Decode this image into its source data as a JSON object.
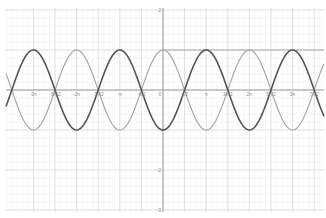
{
  "chart_data": {
    "type": "line",
    "title": "",
    "xlabel": "",
    "ylabel": "",
    "xlim": [
      -9.6,
      11.7
    ],
    "ylim": [
      -3.2,
      2.25
    ],
    "grid": true,
    "x_ticks": [
      "-3π",
      "-5π/2",
      "-2π",
      "-3π/2",
      "-π",
      "-π/2",
      "0",
      "π/2",
      "π",
      "3π/2",
      "2π",
      "5π/2",
      "3π",
      "7π/2"
    ],
    "x_tick_values": [
      -9.4248,
      -7.854,
      -6.2832,
      -4.7124,
      -3.1416,
      -1.5708,
      0,
      1.5708,
      3.1416,
      4.7124,
      6.2832,
      7.854,
      9.4248,
      10.9956
    ],
    "y_ticks": [
      "2",
      "-2",
      "-3"
    ],
    "y_tick_values": [
      2,
      -2,
      -3
    ],
    "series": [
      {
        "name": "cos(x)",
        "color": "#a8a8a8",
        "formula": "cos(x)",
        "width": 1.2
      },
      {
        "name": "-cos(x)",
        "color": "#555555",
        "formula": "-cos(x)",
        "width": 1.6
      }
    ],
    "annotations": [
      {
        "type": "hline",
        "y": 1,
        "x_from": 0,
        "x_to": 11.7,
        "color": "#999999"
      }
    ]
  },
  "layout": {
    "origin_px": [
      163,
      90
    ],
    "x_px_per_unit": 13.75,
    "y_px_per_unit": 40
  }
}
